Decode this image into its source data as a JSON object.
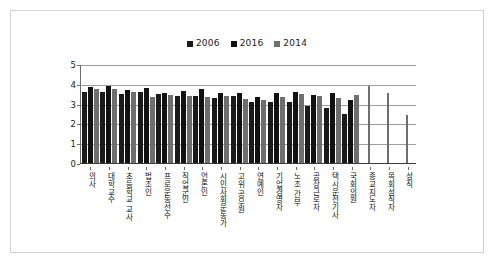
{
  "chart_data": {
    "type": "bar",
    "title": "",
    "xlabel": "",
    "ylabel": "",
    "ylim": [
      0,
      5
    ],
    "yticks": [
      0,
      1,
      2,
      3,
      4,
      5
    ],
    "grid": true,
    "legend_position": "top-center",
    "categories": [
      "의사",
      "대학교수",
      "초등학교 교사",
      "법조인",
      "프로운동선수",
      "직업군인",
      "언론인",
      "시민사회운동가",
      "고위 공무원",
      "연예인",
      "기업경영자",
      "노조 간부",
      "공장근로자",
      "택시운전기사",
      "국회의원",
      "종교지도자",
      "목회성직자",
      "성직"
    ],
    "series": [
      {
        "name": "2006",
        "color": "#1a1a1a",
        "values": [
          3.6,
          3.6,
          3.5,
          3.6,
          3.5,
          3.4,
          3.4,
          3.3,
          3.4,
          3.1,
          3.1,
          3.1,
          2.9,
          2.8,
          2.5,
          null,
          null,
          null
        ]
      },
      {
        "name": "2016",
        "color": "#111111",
        "values": [
          3.85,
          3.9,
          3.7,
          3.8,
          3.55,
          3.65,
          3.75,
          3.55,
          3.55,
          3.35,
          3.55,
          3.6,
          3.45,
          3.55,
          3.2,
          null,
          null,
          null
        ]
      },
      {
        "name": "2014",
        "color": "#6e6e6e",
        "values": [
          3.75,
          3.75,
          3.6,
          3.35,
          3.45,
          3.4,
          3.35,
          3.4,
          3.25,
          3.2,
          3.35,
          3.5,
          3.4,
          3.3,
          3.45,
          3.9,
          3.55,
          2.4
        ]
      }
    ],
    "legend": [
      {
        "label": "2006",
        "color": "#1a1a1a"
      },
      {
        "label": "2016",
        "color": "#111111"
      },
      {
        "label": "2014",
        "color": "#6e6e6e"
      }
    ]
  },
  "colors": {
    "frame_border": "#d2d2d2",
    "gridline": "#9e9e9e",
    "axis": "#6b6b6b",
    "background": "#ffffff",
    "text": "#1a1a1a"
  }
}
